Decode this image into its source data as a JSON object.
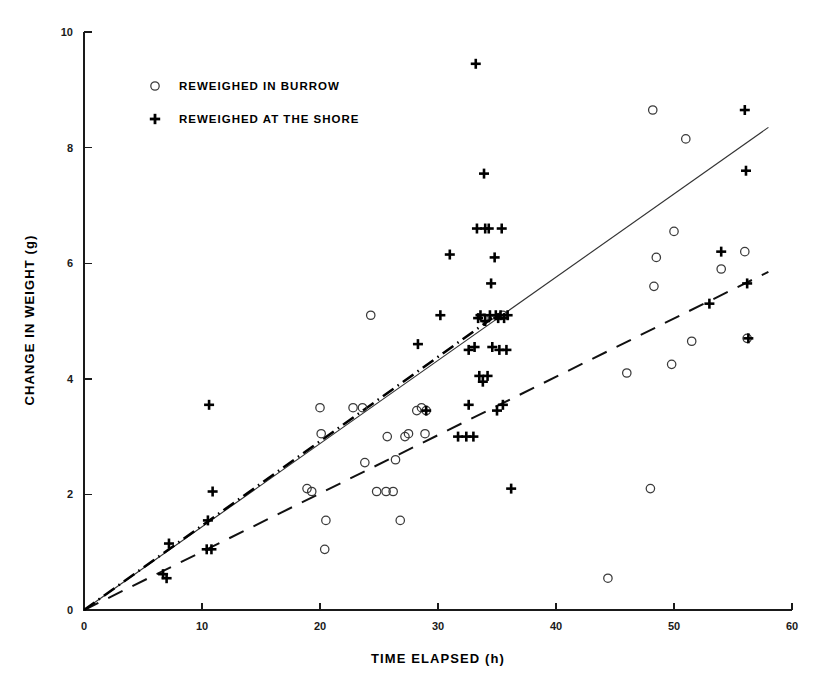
{
  "chart_data": {
    "type": "scatter",
    "title": "",
    "xlabel": "TIME  ELAPSED (h)",
    "ylabel": "CHANGE  IN  WEIGHT (g)",
    "xlim": [
      0,
      60
    ],
    "ylim": [
      0,
      10
    ],
    "xticks": [
      0,
      10,
      20,
      30,
      40,
      50,
      60
    ],
    "yticks": [
      0,
      2,
      4,
      6,
      8,
      10
    ],
    "xtick_labels": [
      "0",
      "10",
      "20",
      "30",
      "40",
      "50",
      "60"
    ],
    "ytick_labels": [
      "0",
      "2",
      "4",
      "6",
      "8",
      "10"
    ],
    "grid": false,
    "legend_position": "upper-left-inside",
    "legend": [
      {
        "marker": "circle",
        "label": "REWEIGHED IN BURROW"
      },
      {
        "marker": "plus",
        "label": "REWEIGHED AT THE SHORE"
      }
    ],
    "series": [
      {
        "name": "REWEIGHED IN BURROW",
        "marker": "circle",
        "points": [
          [
            18.9,
            2.1
          ],
          [
            19.3,
            2.05
          ],
          [
            20.0,
            3.5
          ],
          [
            20.1,
            3.05
          ],
          [
            20.4,
            1.05
          ],
          [
            20.5,
            1.55
          ],
          [
            22.8,
            3.5
          ],
          [
            23.6,
            3.5
          ],
          [
            23.8,
            2.55
          ],
          [
            24.3,
            5.1
          ],
          [
            24.8,
            2.05
          ],
          [
            25.6,
            2.05
          ],
          [
            25.7,
            3.0
          ],
          [
            26.2,
            2.05
          ],
          [
            26.4,
            2.6
          ],
          [
            26.8,
            1.55
          ],
          [
            27.2,
            3.0
          ],
          [
            27.5,
            3.05
          ],
          [
            28.2,
            3.45
          ],
          [
            28.6,
            3.5
          ],
          [
            28.9,
            3.05
          ],
          [
            29.0,
            3.45
          ],
          [
            33.9,
            5.05
          ],
          [
            35.5,
            5.1
          ],
          [
            44.4,
            0.55
          ],
          [
            46.0,
            4.1
          ],
          [
            48.0,
            2.1
          ],
          [
            48.2,
            8.65
          ],
          [
            48.3,
            5.6
          ],
          [
            48.5,
            6.1
          ],
          [
            49.8,
            4.25
          ],
          [
            50.0,
            6.55
          ],
          [
            51.0,
            8.15
          ],
          [
            51.5,
            4.65
          ],
          [
            54.0,
            5.9
          ],
          [
            56.0,
            6.2
          ],
          [
            56.2,
            4.7
          ]
        ]
      },
      {
        "name": "REWEIGHED AT THE SHORE",
        "marker": "plus",
        "points": [
          [
            6.7,
            0.62
          ],
          [
            7.0,
            0.55
          ],
          [
            7.2,
            1.15
          ],
          [
            10.4,
            1.05
          ],
          [
            10.8,
            1.05
          ],
          [
            10.5,
            1.55
          ],
          [
            10.6,
            3.55
          ],
          [
            10.9,
            2.05
          ],
          [
            28.3,
            4.6
          ],
          [
            29.0,
            3.45
          ],
          [
            30.2,
            5.1
          ],
          [
            31.0,
            6.15
          ],
          [
            31.7,
            3.0
          ],
          [
            32.4,
            3.0
          ],
          [
            32.6,
            4.5
          ],
          [
            32.6,
            3.55
          ],
          [
            33.0,
            3.0
          ],
          [
            33.1,
            4.55
          ],
          [
            33.2,
            9.45
          ],
          [
            33.3,
            6.6
          ],
          [
            33.4,
            5.05
          ],
          [
            33.5,
            4.05
          ],
          [
            33.6,
            5.1
          ],
          [
            33.8,
            3.95
          ],
          [
            33.9,
            7.55
          ],
          [
            34.0,
            6.6
          ],
          [
            34.0,
            5.0
          ],
          [
            34.2,
            4.05
          ],
          [
            34.3,
            6.6
          ],
          [
            34.4,
            5.1
          ],
          [
            34.5,
            5.65
          ],
          [
            34.6,
            4.55
          ],
          [
            34.8,
            6.1
          ],
          [
            34.9,
            5.1
          ],
          [
            35.0,
            3.45
          ],
          [
            35.1,
            5.05
          ],
          [
            35.2,
            4.5
          ],
          [
            35.3,
            5.1
          ],
          [
            35.4,
            6.6
          ],
          [
            35.5,
            3.55
          ],
          [
            35.6,
            5.05
          ],
          [
            35.8,
            4.5
          ],
          [
            35.9,
            5.1
          ],
          [
            36.2,
            2.1
          ],
          [
            53.0,
            5.3
          ],
          [
            54.0,
            6.2
          ],
          [
            56.0,
            8.65
          ],
          [
            56.1,
            7.6
          ],
          [
            56.2,
            5.65
          ],
          [
            56.3,
            4.7
          ]
        ]
      }
    ],
    "fit_lines": [
      {
        "name": "solid-regression-line",
        "style": "solid",
        "from": [
          0.0,
          0.0
        ],
        "to": [
          58.0,
          8.35
        ]
      },
      {
        "name": "dashed-regression-line",
        "style": "dashed",
        "from": [
          0.0,
          0.0
        ],
        "to": [
          58.0,
          5.85
        ]
      },
      {
        "name": "dash-dot-line",
        "style": "dash-dot",
        "from": [
          0.0,
          0.0
        ],
        "to": [
          34.6,
          5.05
        ]
      }
    ]
  },
  "axes": {
    "x_title": "TIME  ELAPSED (h)",
    "y_title": "CHANGE  IN  WEIGHT (g)"
  },
  "colors": {
    "marker": "#000000",
    "circle_stroke": "#3a3a3a",
    "axis": "#1a1a1a",
    "background": "#ffffff"
  }
}
